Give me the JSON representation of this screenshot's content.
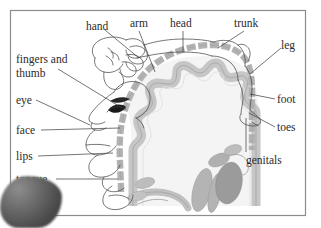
{
  "figure": {
    "type": "anatomical-diagram",
    "frame_color": "#8a8a8a",
    "background_color": "#ffffff",
    "cortex_band_color": "#b6b6b6",
    "cortex_ribbon_color": "#c9c9c9",
    "brain_interior_color": "#f2f2f2",
    "deep_nuclei_color": "#a9a9a9",
    "label_color": "#2b2b2b",
    "outline_color": "#3a3a3a"
  },
  "labels": {
    "hand": "hand",
    "arm": "arm",
    "head": "head",
    "trunk": "trunk",
    "leg": "leg",
    "foot": "foot",
    "toes": "toes",
    "genitals": "genitals",
    "fingers_and": "fingers and",
    "thumb": "thumb",
    "eye": "eye",
    "face": "face",
    "lips": "lips",
    "tongue": "tongue"
  }
}
